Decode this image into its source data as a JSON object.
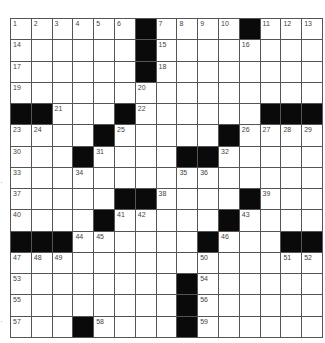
{
  "puzzle": {
    "rows": 15,
    "cols": 15,
    "colors": {
      "black": "#0a0a0a",
      "white": "#ffffff",
      "gridline": "#555555",
      "number": "#444444"
    },
    "black_cells": [
      [
        0,
        6
      ],
      [
        0,
        11
      ],
      [
        1,
        6
      ],
      [
        2,
        6
      ],
      [
        4,
        0
      ],
      [
        4,
        1
      ],
      [
        4,
        5
      ],
      [
        4,
        12
      ],
      [
        4,
        13
      ],
      [
        4,
        14
      ],
      [
        5,
        4
      ],
      [
        5,
        10
      ],
      [
        6,
        3
      ],
      [
        6,
        8
      ],
      [
        6,
        9
      ],
      [
        8,
        5
      ],
      [
        8,
        6
      ],
      [
        8,
        11
      ],
      [
        9,
        4
      ],
      [
        9,
        10
      ],
      [
        10,
        0
      ],
      [
        10,
        1
      ],
      [
        10,
        2
      ],
      [
        10,
        9
      ],
      [
        10,
        13
      ],
      [
        10,
        14
      ],
      [
        12,
        8
      ],
      [
        13,
        8
      ],
      [
        14,
        3
      ],
      [
        14,
        8
      ]
    ],
    "numbers": [
      {
        "r": 0,
        "c": 0,
        "n": "1"
      },
      {
        "r": 0,
        "c": 1,
        "n": "2"
      },
      {
        "r": 0,
        "c": 2,
        "n": "3"
      },
      {
        "r": 0,
        "c": 3,
        "n": "4"
      },
      {
        "r": 0,
        "c": 4,
        "n": "5"
      },
      {
        "r": 0,
        "c": 5,
        "n": "6"
      },
      {
        "r": 0,
        "c": 7,
        "n": "7"
      },
      {
        "r": 0,
        "c": 8,
        "n": "8"
      },
      {
        "r": 0,
        "c": 9,
        "n": "9"
      },
      {
        "r": 0,
        "c": 10,
        "n": "10"
      },
      {
        "r": 0,
        "c": 12,
        "n": "11"
      },
      {
        "r": 0,
        "c": 13,
        "n": "12"
      },
      {
        "r": 0,
        "c": 14,
        "n": "13"
      },
      {
        "r": 1,
        "c": 0,
        "n": "14"
      },
      {
        "r": 1,
        "c": 7,
        "n": "15"
      },
      {
        "r": 1,
        "c": 11,
        "n": "16"
      },
      {
        "r": 2,
        "c": 0,
        "n": "17"
      },
      {
        "r": 2,
        "c": 7,
        "n": "18"
      },
      {
        "r": 3,
        "c": 0,
        "n": "19"
      },
      {
        "r": 3,
        "c": 6,
        "n": "20"
      },
      {
        "r": 4,
        "c": 2,
        "n": "21"
      },
      {
        "r": 4,
        "c": 6,
        "n": "22"
      },
      {
        "r": 5,
        "c": 0,
        "n": "23"
      },
      {
        "r": 5,
        "c": 1,
        "n": "24"
      },
      {
        "r": 5,
        "c": 5,
        "n": "25"
      },
      {
        "r": 5,
        "c": 11,
        "n": "26"
      },
      {
        "r": 5,
        "c": 12,
        "n": "27"
      },
      {
        "r": 5,
        "c": 13,
        "n": "28"
      },
      {
        "r": 5,
        "c": 14,
        "n": "29"
      },
      {
        "r": 6,
        "c": 0,
        "n": "30"
      },
      {
        "r": 6,
        "c": 4,
        "n": "31"
      },
      {
        "r": 6,
        "c": 10,
        "n": "32"
      },
      {
        "r": 7,
        "c": 0,
        "n": "33"
      },
      {
        "r": 7,
        "c": 3,
        "n": "34"
      },
      {
        "r": 7,
        "c": 8,
        "n": "35"
      },
      {
        "r": 7,
        "c": 9,
        "n": "36"
      },
      {
        "r": 8,
        "c": 0,
        "n": "37"
      },
      {
        "r": 8,
        "c": 7,
        "n": "38"
      },
      {
        "r": 8,
        "c": 12,
        "n": "39"
      },
      {
        "r": 9,
        "c": 0,
        "n": "40"
      },
      {
        "r": 9,
        "c": 5,
        "n": "41"
      },
      {
        "r": 9,
        "c": 6,
        "n": "42"
      },
      {
        "r": 9,
        "c": 11,
        "n": "43"
      },
      {
        "r": 10,
        "c": 3,
        "n": "44"
      },
      {
        "r": 10,
        "c": 4,
        "n": "45"
      },
      {
        "r": 10,
        "c": 10,
        "n": "46"
      },
      {
        "r": 11,
        "c": 0,
        "n": "47"
      },
      {
        "r": 11,
        "c": 1,
        "n": "48"
      },
      {
        "r": 11,
        "c": 2,
        "n": "49"
      },
      {
        "r": 11,
        "c": 9,
        "n": "50"
      },
      {
        "r": 11,
        "c": 13,
        "n": "51"
      },
      {
        "r": 11,
        "c": 14,
        "n": "52"
      },
      {
        "r": 12,
        "c": 0,
        "n": "53"
      },
      {
        "r": 12,
        "c": 9,
        "n": "54"
      },
      {
        "r": 13,
        "c": 0,
        "n": "55"
      },
      {
        "r": 13,
        "c": 9,
        "n": "56"
      },
      {
        "r": 14,
        "c": 0,
        "n": "57"
      },
      {
        "r": 14,
        "c": 4,
        "n": "58"
      },
      {
        "r": 14,
        "c": 9,
        "n": "59"
      }
    ]
  },
  "margin_marks": [
    {
      "y": 181,
      "text": "'"
    },
    {
      "y": 320,
      "text": "'"
    }
  ]
}
